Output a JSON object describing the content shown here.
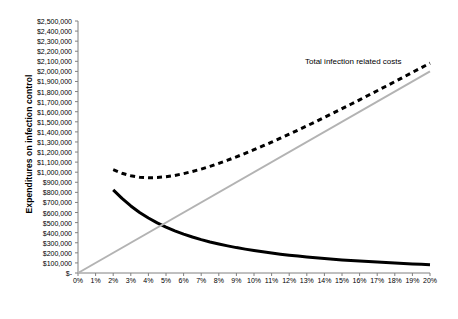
{
  "chart_data": {
    "type": "line",
    "title": "",
    "xlabel": "Incidence rate of HAI",
    "ylabel": "Expenditures on infection control",
    "xlim": [
      0,
      20
    ],
    "ylim": [
      0,
      2500000
    ],
    "grid": false,
    "legend_position": "inline-annotation",
    "x_tick_labels": [
      "0%",
      "1%",
      "2%",
      "3%",
      "4%",
      "5%",
      "6%",
      "7%",
      "8%",
      "9%",
      "10%",
      "11%",
      "12%",
      "13%",
      "14%",
      "15%",
      "16%",
      "17%",
      "18%",
      "19%",
      "20%"
    ],
    "x_tick_values": [
      0,
      1,
      2,
      3,
      4,
      5,
      6,
      7,
      8,
      9,
      10,
      11,
      12,
      13,
      14,
      15,
      16,
      17,
      18,
      19,
      20
    ],
    "y_tick_labels": [
      "$-",
      "$100,000",
      "$200,000",
      "$300,000",
      "$400,000",
      "$500,000",
      "$600,000",
      "$700,000",
      "$800,000",
      "$900,000",
      "$1,000,000",
      "$1,100,000",
      "$1,200,000",
      "$1,300,000",
      "$1,400,000",
      "$1,500,000",
      "$1,600,000",
      "$1,700,000",
      "$1,800,000",
      "$1,900,000",
      "$2,000,000",
      "$2,100,000",
      "$2,200,000",
      "$2,300,000",
      "$2,400,000",
      "$2,500,000"
    ],
    "y_tick_values": [
      0,
      100000,
      200000,
      300000,
      400000,
      500000,
      600000,
      700000,
      800000,
      900000,
      1000000,
      1100000,
      1200000,
      1300000,
      1400000,
      1500000,
      1600000,
      1700000,
      1800000,
      1900000,
      2000000,
      2100000,
      2200000,
      2300000,
      2400000,
      2500000
    ],
    "annotations": [
      {
        "text": "Total infection related costs",
        "x": 13.0,
        "y": 2100000
      }
    ],
    "series": [
      {
        "name": "Cost of infection control",
        "style": "solid",
        "color": "#000000",
        "width": 3,
        "x": [
          2.0,
          2.5,
          3,
          3.5,
          4,
          4.5,
          5,
          5.5,
          6,
          6.5,
          7,
          7.5,
          8,
          8.5,
          9,
          9.5,
          10,
          10.5,
          11,
          11.5,
          12,
          12.5,
          13,
          13.5,
          14,
          14.5,
          15,
          15.5,
          16,
          16.5,
          17,
          17.5,
          18,
          18.5,
          19,
          19.5,
          20
        ],
        "values": [
          825000,
          740000,
          665000,
          600000,
          545000,
          497000,
          455000,
          418000,
          386000,
          357000,
          331000,
          308000,
          288000,
          269000,
          252000,
          237000,
          223000,
          210000,
          198000,
          187000,
          177000,
          168000,
          159000,
          151000,
          144000,
          137000,
          130000,
          124000,
          118000,
          113000,
          108000,
          103000,
          98000,
          94000,
          90000,
          86000,
          82000
        ]
      },
      {
        "name": "Cost of infections",
        "style": "solid",
        "color": "#b3b3b3",
        "width": 2,
        "x": [
          0,
          20
        ],
        "values": [
          0,
          2000000
        ]
      },
      {
        "name": "Total infection related costs",
        "style": "dashed",
        "color": "#000000",
        "width": 3,
        "x": [
          2.0,
          2.5,
          3,
          3.5,
          4,
          4.5,
          5,
          5.5,
          6,
          6.5,
          7,
          7.5,
          8,
          8.5,
          9,
          9.5,
          10,
          10.5,
          11,
          11.5,
          12,
          12.5,
          13,
          13.5,
          14,
          14.5,
          15,
          15.5,
          16,
          16.5,
          17,
          17.5,
          18,
          18.5,
          19,
          19.5,
          20
        ],
        "values": [
          1025000,
          990000,
          965000,
          950000,
          945000,
          947000,
          955000,
          968000,
          986000,
          1007000,
          1031000,
          1058000,
          1088000,
          1119000,
          1152000,
          1187000,
          1223000,
          1260000,
          1298000,
          1337000,
          1377000,
          1418000,
          1459000,
          1501000,
          1544000,
          1587000,
          1630000,
          1674000,
          1718000,
          1763000,
          1808000,
          1853000,
          1898000,
          1944000,
          1990000,
          2036000,
          2082000
        ]
      }
    ]
  }
}
